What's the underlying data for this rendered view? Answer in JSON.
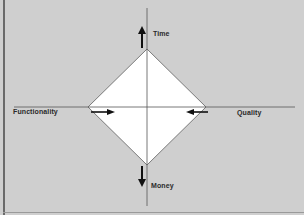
{
  "diagram": {
    "type": "project-management-tradeoff-diamond",
    "axes": {
      "top": {
        "label": "Time",
        "arrow": "up"
      },
      "bottom": {
        "label": "Money",
        "arrow": "down"
      },
      "left": {
        "label": "Functionality",
        "arrow": "right"
      },
      "right": {
        "label": "Quality",
        "arrow": "left"
      }
    },
    "colors": {
      "background": "#cfcfcf",
      "diamond_fill": "#ffffff",
      "diamond_stroke": "#7a7a7a",
      "axis": "#555555",
      "arrow": "#111111",
      "text": "#2a2a2a"
    }
  }
}
